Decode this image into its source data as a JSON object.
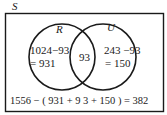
{
  "universe_label": "S",
  "sets": [
    {
      "label": "R",
      "only_expr": "1024−93",
      "only_value": "= 931"
    },
    {
      "label": "U",
      "only_expr": "243 −93",
      "only_value": "= 150"
    }
  ],
  "intersection": "93",
  "outside_equation": "1556 − ( 931 + 9 3 + 150 ) = 382",
  "colors": {
    "stroke": "#1a1a1a",
    "background": "#ffffff"
  }
}
